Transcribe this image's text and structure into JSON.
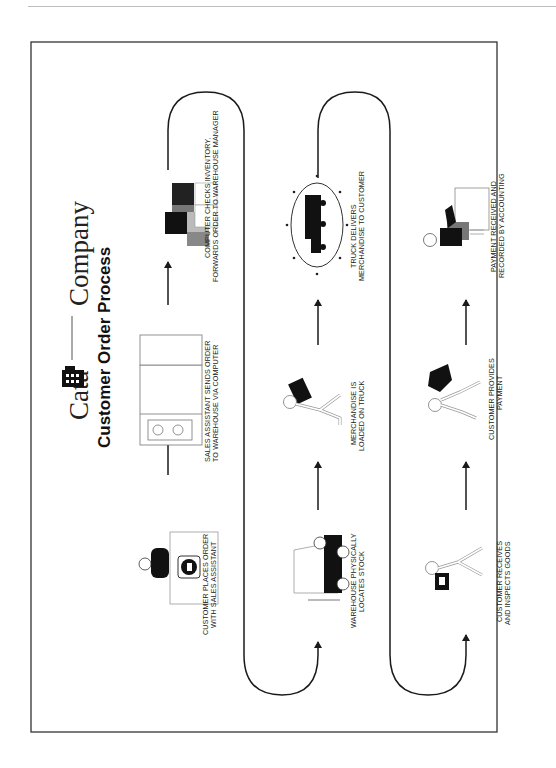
{
  "header": {
    "brand_left": "Cata",
    "brand_right": "Company",
    "brand_icon": "telephone-book-icon",
    "title": "Customer Order Process"
  },
  "steps": [
    {
      "line1": "CUSTOMER PLACES ORDER",
      "line2": "WITH SALES ASSISTANT",
      "icon": "customer-phone-icon"
    },
    {
      "line1": "SALES ASSISTANT SENDS ORDER",
      "line2": "TO WAREHOUSE VIA COMPUTER",
      "icon": "computer-terminal-icon"
    },
    {
      "line1": "COMPUTER CHECKS INVENTORY,",
      "line2": "FORWARDS ORDER TO WAREHOUSE MANAGER",
      "icon": "inventory-boxes-icon"
    },
    {
      "line1": "WAREHOUSE PHYSICALLY",
      "line2": "LOCATES STOCK",
      "icon": "forklift-icon"
    },
    {
      "line1": "MERCHANDISE IS",
      "line2": "LOADED ON TRUCK",
      "icon": "person-carrying-box-icon"
    },
    {
      "line1": "TRUCK DELIVERS",
      "line2": "MERCHANDISE TO CUSTOMER",
      "icon": "delivery-truck-icon"
    },
    {
      "line1": "CUSTOMER RECEIVES",
      "line2": "AND INSPECTS GOODS",
      "icon": "person-inspecting-box-icon"
    },
    {
      "line1": "CUSTOMER PROVIDES",
      "line2": "PAYMENT",
      "icon": "person-handing-payment-icon"
    },
    {
      "line1": "PAYMENT RECEIVED AND",
      "line2": "RECORDED BY ACCOUNTING",
      "icon": "accountant-desk-icon"
    }
  ],
  "colors": {
    "line": "#1a1a1a",
    "frame": "#333333",
    "fill_dark": "#111111",
    "fill_mid": "#6b6b6b",
    "fill_light": "#b5b5b5"
  }
}
